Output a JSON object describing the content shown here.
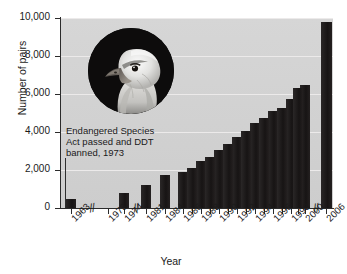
{
  "chart_data": {
    "type": "bar",
    "title": "",
    "xlabel": "Year",
    "ylabel": "Number of pairs",
    "categories": [
      "1963",
      "1973",
      "1974",
      "1981",
      "1984",
      "1986",
      "1988",
      "1990",
      "1992",
      "1994",
      "1996",
      "1998",
      "2000",
      "2006"
    ],
    "values": [
      487,
      null,
      791,
      1188,
      1757,
      1875,
      2475,
      3035,
      3749,
      4449,
      5094,
      5748,
      6471,
      9789
    ],
    "ylim": [
      0,
      10000
    ],
    "ytick_labels": [
      "0",
      "2,000",
      "4,000",
      "6,000",
      "8,000",
      "10,000"
    ],
    "ytick_values": [
      0,
      2000,
      4000,
      6000,
      8000,
      10000
    ],
    "grid": "horizontal",
    "legend": "none",
    "annotations": [
      {
        "text_line1": "Endangered Species",
        "text_line2": "Act passed and DDT",
        "text_line3": "banned, 1973",
        "at_category": "1973"
      }
    ],
    "axis_breaks": [
      "after 1963",
      "after 1974",
      "after 2000"
    ],
    "bar_color": "#201d1d",
    "plot_background": "#d2d2d2",
    "image_inset": "bald-eagle-photo"
  },
  "axis": {
    "y_title": "Number of pairs",
    "x_title": "Year",
    "y_ticks": [
      {
        "label": "10,000",
        "value": 10000
      },
      {
        "label": "8,000",
        "value": 8000
      },
      {
        "label": "6,000",
        "value": 6000
      },
      {
        "label": "4,000",
        "value": 4000
      },
      {
        "label": "2,000",
        "value": 2000
      },
      {
        "label": "0",
        "value": 0
      }
    ],
    "x_ticks": [
      {
        "label": "1963"
      },
      {
        "label": "1973"
      },
      {
        "label": "1974"
      },
      {
        "label": "1981"
      },
      {
        "label": "1984"
      },
      {
        "label": "1986"
      },
      {
        "label": "1988"
      },
      {
        "label": "1990"
      },
      {
        "label": "1992"
      },
      {
        "label": "1994"
      },
      {
        "label": "1996"
      },
      {
        "label": "1998"
      },
      {
        "label": "2000"
      },
      {
        "label": "2006"
      }
    ]
  },
  "annotation": {
    "line1": "Endangered Species",
    "line2": "Act passed and DDT",
    "line3": "banned, 1973"
  },
  "break_marks": {
    "glyph": "//"
  },
  "colors": {
    "bar": "#201d1d",
    "plot_bg": "#d2d2d2",
    "grid": "#eceaea",
    "axis": "#2b2b2b",
    "text": "#1a1a1a"
  }
}
